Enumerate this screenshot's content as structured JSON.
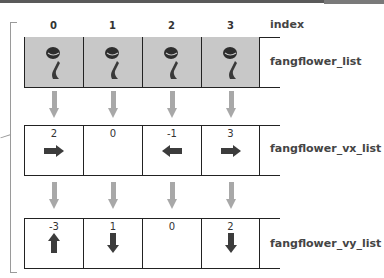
{
  "index_header": {
    "label": "index",
    "values": [
      "0",
      "1",
      "2",
      "3"
    ]
  },
  "rows": [
    {
      "name": "fangflower_list",
      "label": "fangflower_list",
      "cells": [
        "fangflower",
        "fangflower",
        "fangflower",
        "fangflower"
      ]
    },
    {
      "name": "fangflower_vx_list",
      "label": "fangflower_vx_list",
      "values": [
        "2",
        "0",
        "-1",
        "3"
      ],
      "arrows": [
        "right",
        "none",
        "left",
        "right"
      ]
    },
    {
      "name": "fangflower_vy_list",
      "label": "fangflower_vy_list",
      "values": [
        "-3",
        "1",
        "0",
        "2"
      ],
      "arrows": [
        "up",
        "down",
        "none",
        "down"
      ]
    }
  ],
  "colors": {
    "cell_fill": "#c8c8c8",
    "flow_arrow": "#a8a8a8",
    "dir_arrow": "#3c3c3c",
    "line": "#222222"
  }
}
